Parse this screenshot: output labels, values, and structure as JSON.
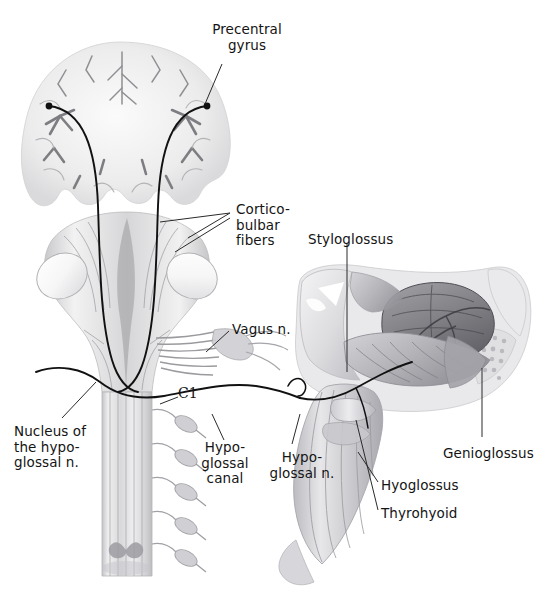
{
  "figure": {
    "background_color": "#ffffff",
    "ink_color": "#141414",
    "width": 545,
    "height": 594
  },
  "labels": {
    "precentral_gyrus": "Precentral\ngyrus",
    "corticobulbar_fibers": "Cortico-\nbulbar\nfibers",
    "styloglossus": "Styloglossus",
    "vagus_n": "Vagus n.",
    "c1": "C1",
    "nucleus_hypoglossal": "Nucleus of\nthe hypo-\nglossal n.",
    "hypoglossal_canal": "Hypo-\nglossal\ncanal",
    "hypoglossal_n": "Hypo-\nglossal n.",
    "genioglossus": "Genioglossus",
    "hyoglossus": "Hyoglossus",
    "thyrohyoid": "Thyrohyoid"
  },
  "structures": {
    "brain_section": "coronal-brain-section",
    "brainstem": "brainstem-dorsal-view",
    "spinal_cord": "spinal-cord-with-rootlets",
    "head_dissection": "lateral-head-tongue-dissection",
    "tongue": "tongue-muscle-mass",
    "mandible": "mandible-bone",
    "cerebellar_peduncle_left": "cut-cerebellar-peduncle-left",
    "cerebellar_peduncle_right": "cut-cerebellar-peduncle-right"
  }
}
